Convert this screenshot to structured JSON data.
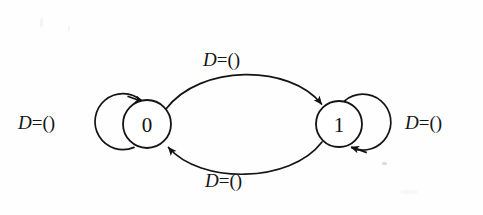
{
  "diagram": {
    "kind": "state-transition-diagram",
    "background_color": "#fefefe",
    "ink_color": "#141414",
    "states": [
      {
        "id": "s0",
        "label": "0",
        "cx": 147,
        "cy": 124,
        "r": 24
      },
      {
        "id": "s1",
        "label": "1",
        "cx": 339,
        "cy": 124,
        "r": 23
      }
    ],
    "transitions": [
      {
        "id": "t-self-0",
        "type": "self-loop",
        "from": "0",
        "to": "0",
        "label": "D=()",
        "label_position": "left",
        "arrow_position": "top-right",
        "loop_cx": 117,
        "loop_cy": 127,
        "loop_r": 28
      },
      {
        "id": "t-0-to-1",
        "type": "arc",
        "from": "0",
        "to": "1",
        "label": "D=()",
        "label_position": "top",
        "arrow_position": "upper-left-of-state-1"
      },
      {
        "id": "t-1-to-0",
        "type": "arc",
        "from": "1",
        "to": "0",
        "label": "D=()",
        "label_position": "bottom",
        "arrow_position": "lower-right-of-state-0"
      },
      {
        "id": "t-self-1",
        "type": "self-loop",
        "from": "1",
        "to": "1",
        "label": "D=()",
        "label_position": "right",
        "arrow_position": "bottom-left",
        "loop_cx": 369,
        "loop_cy": 127,
        "loop_r": 28
      }
    ],
    "labels": {
      "left": {
        "var": "D",
        "eq": "=",
        "value": "()"
      },
      "top": {
        "var": "D",
        "eq": "=",
        "value": "()"
      },
      "bottom": {
        "var": "D",
        "eq": "=",
        "value": "()"
      },
      "right": {
        "var": "D",
        "eq": "=",
        "value": "()"
      }
    }
  }
}
